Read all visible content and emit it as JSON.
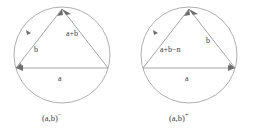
{
  "figure": {
    "type": "geometric-diagram-pair",
    "stroke_color": "#9b9b9b",
    "text_color": "#3d3d3d",
    "background_color": "#ffffff",
    "panels": [
      {
        "id": "left",
        "caption_base": "(a,b)",
        "caption_superscript": "−",
        "caption_full": "(a,b)⁻",
        "edges": [
          {
            "name": "left-edge",
            "label": "b"
          },
          {
            "name": "right-edge",
            "label": "a+b"
          },
          {
            "name": "bottom-edge",
            "label": "a"
          }
        ]
      },
      {
        "id": "right",
        "caption_base": "(a,b)",
        "caption_superscript": "+",
        "caption_full": "(a,b)⁺",
        "edges": [
          {
            "name": "left-edge",
            "label": "a+b−n"
          },
          {
            "name": "right-edge",
            "label": "b"
          },
          {
            "name": "bottom-edge",
            "label": "a"
          }
        ]
      }
    ]
  }
}
